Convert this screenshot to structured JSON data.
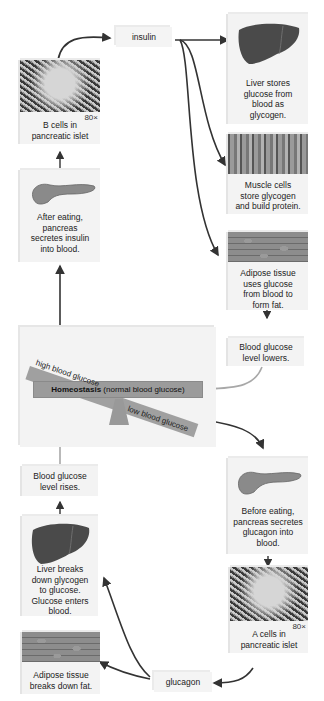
{
  "diagram": {
    "hormones": {
      "insulin": "insulin",
      "glucagon": "glucagon"
    },
    "high_path": {
      "b_cells": {
        "label": "B cells in pancreatic islet",
        "line1": "B cells in",
        "line2": "pancreatic islet",
        "magnification": "80×"
      },
      "pancreas_after_eating": {
        "lines": [
          "After eating,",
          "pancreas",
          "secretes insulin",
          "into blood."
        ]
      },
      "liver_stores": {
        "lines": [
          "Liver stores",
          "glucose from",
          "blood as",
          "glycogen."
        ]
      },
      "muscle_cells": {
        "lines": [
          "Muscle cells",
          "store glycogen",
          "and build protein."
        ]
      },
      "adipose_uses": {
        "lines": [
          "Adipose tissue",
          "uses glucose",
          "from blood to",
          "form fat."
        ]
      },
      "glucose_lowers": {
        "lines": [
          "Blood glucose",
          "level lowers."
        ]
      }
    },
    "homeostasis": {
      "bold": "Homeostasis",
      "rest": " (normal blood glucose)",
      "high_label": "high blood glucose",
      "low_label": "low blood glucose"
    },
    "low_path": {
      "pancreas_before_eating": {
        "lines": [
          "Before eating,",
          "pancreas secretes",
          "glucagon into",
          "blood."
        ]
      },
      "a_cells": {
        "line1": "A cells in",
        "line2": "pancreatic islet",
        "magnification": "80×"
      },
      "liver_breaks": {
        "lines": [
          "Liver breaks",
          "down glycogen",
          "to glucose.",
          "Glucose enters",
          "blood."
        ]
      },
      "adipose_breaks": {
        "lines": [
          "Adipose tissue",
          "breaks down fat."
        ]
      },
      "glucose_rises": {
        "lines": [
          "Blood glucose",
          "level rises."
        ]
      }
    },
    "colors": {
      "box_bg": "#f3f3f3",
      "bar": "#9b9b9b",
      "arrow_dark": "#333333",
      "arrow_light": "#a8a8a8"
    }
  }
}
